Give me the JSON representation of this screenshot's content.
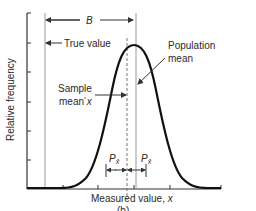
{
  "figure": {
    "panel_label": "(b)",
    "y_axis_label": "Relative frequency",
    "x_axis_label": "Measured value, ",
    "x_axis_var": "x",
    "annotations": {
      "bias": "B",
      "true_value": "True value",
      "sample_mean_line1": "Sample",
      "sample_mean_line2": "mean ",
      "sample_mean_var": "x",
      "population_mean_line1": "Population",
      "population_mean_line2": "mean",
      "precision_left": "P",
      "precision_right": "P",
      "precision_subscript": "x̄"
    },
    "colors": {
      "curve": "#111111",
      "axes": "#333333",
      "reference_lines": "#999999",
      "text": "#2a2a2a"
    }
  }
}
